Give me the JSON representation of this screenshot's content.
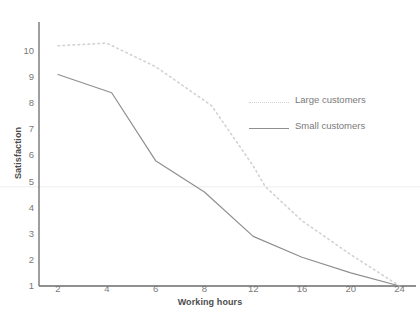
{
  "top_partial_text": "",
  "chart_data": {
    "type": "line",
    "title": "",
    "xlabel": "Working hours",
    "ylabel": "Satisfaction",
    "x_tick_labels": [
      "2",
      "4",
      "6",
      "8",
      "12",
      "16",
      "20",
      "24"
    ],
    "x_tick_values": [
      2,
      4,
      6,
      8,
      12,
      16,
      20,
      24
    ],
    "y_tick_labels": [
      "1",
      "2",
      "3",
      "4",
      "5",
      "6",
      "7",
      "8",
      "9",
      "10"
    ],
    "ylim": [
      1,
      10
    ],
    "grid": "single horizontal reference line near 4.8",
    "gridline_value": 4.8,
    "legend_position": "inside right upper",
    "series": [
      {
        "name": "Large customers",
        "style": "dotted",
        "color": "#d2d2d2",
        "x": [
          2,
          4,
          6,
          8,
          8.6,
          12,
          13,
          16,
          20,
          24
        ],
        "values": [
          10.2,
          10.3,
          9.4,
          8.1,
          7.9,
          5.6,
          4.8,
          3.5,
          2.2,
          1.0
        ]
      },
      {
        "name": "Small customers",
        "style": "solid",
        "color": "#8f8f8f",
        "x": [
          2,
          4.2,
          6,
          8,
          12,
          16,
          20,
          24
        ],
        "values": [
          9.1,
          8.4,
          5.8,
          4.6,
          2.9,
          2.1,
          1.5,
          1.0
        ]
      }
    ]
  }
}
